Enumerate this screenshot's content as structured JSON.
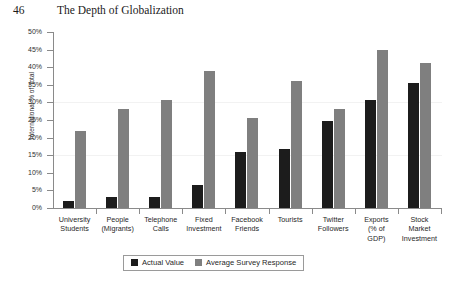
{
  "page": {
    "number": "46",
    "running_head": "The Depth of Globalization"
  },
  "legend": {
    "actual_label": "Actual Value",
    "survey_label": "Average Survey Response"
  },
  "colors": {
    "actual": "#1c1c1c",
    "survey": "#7f7f7f",
    "axis": "#8a8a8a"
  },
  "axis": {
    "y_title": "International % of Total",
    "y_ticks": [
      "0%",
      "5%",
      "10%",
      "15%",
      "20%",
      "25%",
      "30%",
      "35%",
      "40%",
      "45%",
      "50%"
    ]
  },
  "categories_display": [
    [
      "University",
      "Students"
    ],
    [
      "People",
      "(Migrants)"
    ],
    [
      "Telephone",
      "Calls"
    ],
    [
      "Fixed",
      "Investment"
    ],
    [
      "Facebook",
      "Friends"
    ],
    [
      "Tourists"
    ],
    [
      "Twitter",
      "Followers"
    ],
    [
      "Exports",
      "(% of",
      "GDP)"
    ],
    [
      "Stock",
      "Market",
      "Investment"
    ]
  ],
  "chart_data": {
    "type": "bar",
    "title": "",
    "xlabel": "",
    "ylabel": "International % of Total",
    "ylim": [
      0,
      50
    ],
    "ytick_step": 5,
    "grid": false,
    "legend_position": "bottom",
    "categories": [
      "University Students",
      "People (Migrants)",
      "Telephone Calls",
      "Fixed Investment",
      "Facebook Friends",
      "Tourists",
      "Twitter Followers",
      "Exports (% of GDP)",
      "Stock Market Investment"
    ],
    "series": [
      {
        "name": "Actual Value",
        "color": "#1c1c1c",
        "values": [
          2.0,
          3.2,
          3.2,
          6.5,
          15.8,
          16.7,
          24.6,
          30.8,
          35.6
        ]
      },
      {
        "name": "Average Survey Response",
        "color": "#7f7f7f",
        "values": [
          21.8,
          28.1,
          30.8,
          38.9,
          25.6,
          36.2,
          28.1,
          44.8,
          41.1
        ]
      }
    ]
  }
}
